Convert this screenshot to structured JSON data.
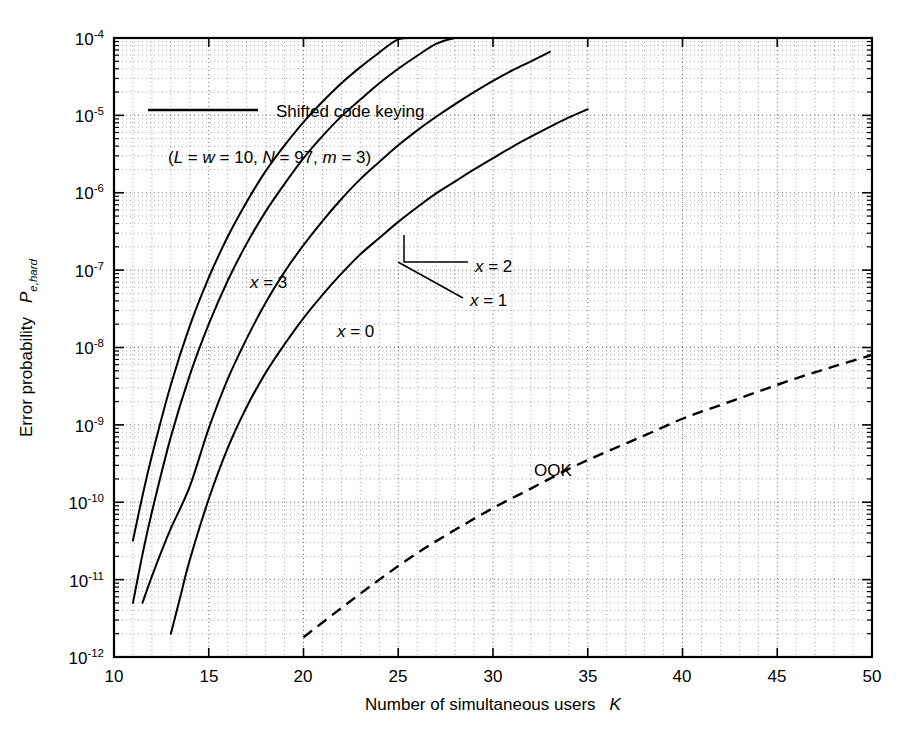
{
  "figure": {
    "background_color": "#ffffff",
    "ink_color": "#000000",
    "grid_color": "#555555"
  },
  "chart_data": {
    "type": "line",
    "title": "",
    "xlabel": "Number of simultaneous users",
    "xlabel_symbol": "K",
    "ylabel": "Error probability",
    "ylabel_symbol": "P",
    "ylabel_symbol_sub": "e,hard",
    "xscale": "linear",
    "yscale": "log",
    "xlim": [
      10,
      50
    ],
    "ylim": [
      1e-12,
      0.0001
    ],
    "grid": true,
    "grid_style": "dotted",
    "grid_minor": true,
    "legend_position": "upper-left-inside",
    "xticks": [
      10,
      15,
      20,
      25,
      30,
      35,
      40,
      45,
      50
    ],
    "xtick_labels": [
      "10",
      "15",
      "20",
      "25",
      "30",
      "35",
      "40",
      "45",
      "50"
    ],
    "yticks": [
      1e-12,
      1e-11,
      1e-10,
      1e-09,
      1e-08,
      1e-07,
      1e-06,
      1e-05,
      0.0001
    ],
    "ytick_labels": [
      {
        "mantissa": "10",
        "exponent": "-12"
      },
      {
        "mantissa": "10",
        "exponent": "-11"
      },
      {
        "mantissa": "10",
        "exponent": "-10"
      },
      {
        "mantissa": "10",
        "exponent": "-9"
      },
      {
        "mantissa": "10",
        "exponent": "-8"
      },
      {
        "mantissa": "10",
        "exponent": "-7"
      },
      {
        "mantissa": "10",
        "exponent": "-6"
      },
      {
        "mantissa": "10",
        "exponent": "-5"
      },
      {
        "mantissa": "10",
        "exponent": "-4"
      }
    ],
    "legend_entries": [
      {
        "label": "Shifted code keying",
        "style": "solid",
        "params": "(L = w = 10, N = 97, m = 3)"
      }
    ],
    "series": [
      {
        "name": "x = 3",
        "label": "x = 3",
        "style": "solid",
        "x": [
          11.0,
          11.5,
          12.0,
          13.0,
          14.0,
          15.0,
          16.0,
          17.0,
          18.0,
          19.0,
          20.0,
          21.0,
          22.0,
          23.0,
          24.0,
          25.0,
          26.0,
          27.0,
          28.0,
          29.0,
          30.0,
          31.0,
          32.0
        ],
        "y": [
          3.2e-11,
          1.2e-10,
          4e-10,
          3.3e-09,
          1.9e-08,
          8e-08,
          2.7e-07,
          7.6e-07,
          1.9e-06,
          4.1e-06,
          8.2e-06,
          1.5e-05,
          2.6e-05,
          4.2e-05,
          6.5e-05,
          9.6e-05,
          0.0001,
          0.0001,
          0.0001,
          0.0001,
          0.0001,
          0.0001,
          0.0001
        ]
      },
      {
        "name": "x = 2",
        "label": "x = 2",
        "style": "solid",
        "x": [
          11.0,
          11.5,
          12.0,
          13.0,
          14.0,
          15.0,
          16.0,
          17.0,
          18.0,
          19.0,
          20.0,
          21.0,
          22.0,
          23.0,
          24.0,
          25.0,
          26.0,
          27.0,
          28.0,
          29.0,
          30.0,
          31.0,
          32.0
        ],
        "y": [
          5e-12,
          2.1e-11,
          7.5e-11,
          7e-10,
          4.4e-09,
          2e-08,
          7.3e-08,
          2.2e-07,
          5.7e-07,
          1.3e-06,
          2.8e-06,
          5.4e-06,
          9.7e-06,
          1.6e-05,
          2.6e-05,
          4e-05,
          5.9e-05,
          8.4e-05,
          0.0001,
          0.0001,
          0.0001,
          0.0001,
          0.0001
        ]
      },
      {
        "name": "x = 1",
        "label": "x = 1",
        "style": "solid",
        "x": [
          11.5,
          12.0,
          12.5,
          13.0,
          14.0,
          15.0,
          16.0,
          17.0,
          18.0,
          19.0,
          20.0,
          21.0,
          22.0,
          23.0,
          24.0,
          25.0,
          26.0,
          27.0,
          28.0,
          29.0,
          30.0,
          31.0,
          32.0,
          33.0
        ],
        "y": [
          5e-12,
          1.1e-11,
          2.3e-11,
          4.6e-11,
          1.6e-10,
          9e-10,
          3.9e-09,
          1.3e-08,
          3.8e-08,
          9.5e-08,
          2.1e-07,
          4.3e-07,
          8.3e-07,
          1.5e-06,
          2.5e-06,
          4.1e-06,
          6.4e-06,
          9.6e-06,
          1.4e-05,
          2e-05,
          2.8e-05,
          3.8e-05,
          5e-05,
          6.6e-05
        ]
      },
      {
        "name": "x = 0",
        "label": "x = 0",
        "style": "solid",
        "x": [
          13.0,
          13.5,
          14.0,
          15.0,
          16.0,
          17.0,
          18.0,
          19.0,
          20.0,
          21.0,
          22.0,
          23.0,
          24.0,
          25.0,
          26.0,
          27.0,
          28.0,
          29.0,
          30.0,
          31.0,
          32.0,
          33.0,
          34.0,
          35.0
        ],
        "y": [
          2e-12,
          6e-12,
          1.8e-11,
          1.1e-10,
          5e-10,
          1.7e-09,
          4.7e-09,
          1.1e-08,
          2.4e-08,
          4.8e-08,
          9e-08,
          1.6e-07,
          2.6e-07,
          4.2e-07,
          6.5e-07,
          9.8e-07,
          1.4e-06,
          2e-06,
          2.8e-06,
          3.9e-06,
          5.3e-06,
          7.1e-06,
          9.4e-06,
          1.2e-05
        ]
      },
      {
        "name": "OOK",
        "label": "OOK",
        "style": "dashed",
        "x": [
          20.0,
          22.0,
          24.0,
          26.0,
          28.0,
          30.0,
          32.0,
          34.0,
          36.0,
          38.0,
          40.0,
          42.0,
          44.0,
          46.0,
          48.0,
          50.0
        ],
        "y": [
          1.8e-12,
          4.3e-12,
          1e-11,
          2.2e-11,
          4.4e-11,
          8.4e-11,
          1.5e-10,
          2.7e-10,
          4.5e-10,
          7.3e-10,
          1.2e-09,
          1.8e-09,
          2.7e-09,
          4e-09,
          5.7e-09,
          8e-09
        ]
      }
    ],
    "annotations": [
      {
        "text": "x = 3",
        "name": "curve-label-x3"
      },
      {
        "text": "x = 2",
        "name": "curve-label-x2"
      },
      {
        "text": "x = 1",
        "name": "curve-label-x1"
      },
      {
        "text": "x = 0",
        "name": "curve-label-x0"
      },
      {
        "text": "OOK",
        "name": "curve-label-ook"
      }
    ]
  },
  "labels": {
    "legend_text": "Shifted code keying",
    "legend_params_open": "(",
    "legend_params": "L = w = 10, N = 97, m = 3)",
    "param_L": "L",
    "param_w": "w",
    "param_N": "N",
    "param_m": "m",
    "eq1": " = ",
    "eq2": " = 10, ",
    "eq3": " = 97, ",
    "eq4": " = 3)",
    "x_label_3": "x = 3",
    "x_label_2": "x = 2",
    "x_label_1": "x = 1",
    "x_label_0": "x = 0",
    "ook_label": "OOK",
    "x_var": "x",
    "val_3": " = 3",
    "val_2": " = 2",
    "val_1": " = 1",
    "val_0": " = 0",
    "xaxis_title": "Number of simultaneous users",
    "xaxis_symbol": "K",
    "yaxis_title": "Error probability",
    "yaxis_symbol": "P",
    "yaxis_symbol_sub": "e,hard",
    "xt_10": "10",
    "xt_15": "15",
    "xt_20": "20",
    "xt_25": "25",
    "xt_30": "30",
    "xt_35": "35",
    "xt_40": "40",
    "xt_45": "45",
    "xt_50": "50",
    "base_10": "10",
    "yt_e4": "-4",
    "yt_e5": "-5",
    "yt_e6": "-6",
    "yt_e7": "-7",
    "yt_e8": "-8",
    "yt_e9": "-9",
    "yt_e10": "-10",
    "yt_e11": "-11",
    "yt_e12": "-12"
  }
}
